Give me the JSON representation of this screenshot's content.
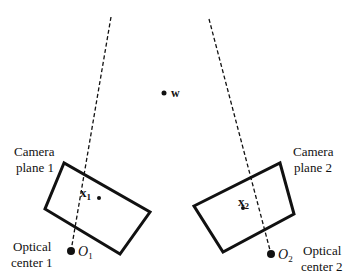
{
  "diagram": {
    "world_point": {
      "label": "w",
      "x": 164,
      "y": 93
    },
    "rays": [
      {
        "name": "ray-camera-1",
        "x1": 111,
        "y1": 17,
        "x2": 71,
        "y2": 251
      },
      {
        "name": "ray-camera-2",
        "x1": 209,
        "y1": 19,
        "x2": 271,
        "y2": 254
      }
    ],
    "camera1": {
      "label_line1": "Camera",
      "label_line2": "plane 1",
      "plane_points": "64,163 45,209 120,254 150,212",
      "image_point": {
        "label": "x",
        "subscript": "1",
        "x": 99,
        "y": 198
      },
      "optical_center": {
        "label": "O",
        "subscript": "1",
        "x": 71,
        "y": 251
      },
      "center_label_line1": "Optical",
      "center_label_line2": "center 1"
    },
    "camera2": {
      "label_line1": "Camera",
      "label_line2": "plane 2",
      "plane_points": "280,163 294,214 223,252 194,206",
      "image_point": {
        "label": "x",
        "subscript": "2",
        "x": 243,
        "y": 208
      },
      "optical_center": {
        "label": "O",
        "subscript": "2",
        "x": 271,
        "y": 254
      },
      "center_label_line1": "Optical",
      "center_label_line2": "center 2"
    },
    "colors": {
      "stroke": "#111111",
      "background": "#ffffff"
    }
  }
}
